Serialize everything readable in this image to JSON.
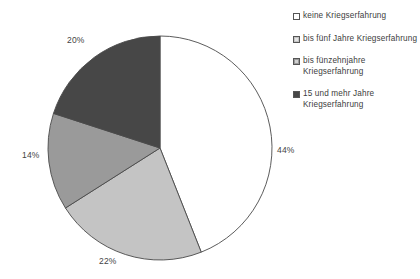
{
  "chart_data": {
    "type": "pie",
    "title": "",
    "subtitle": "",
    "xlabel": "",
    "ylabel": "",
    "grid": false,
    "legend_position": "right",
    "start_angle_deg": 0,
    "direction": "clockwise",
    "categories": [
      "keine Kriegserfahrung",
      "bis fünf Jahre Kriegserfahrung",
      "bis fünzehnjahre Kriegserfahrung",
      "15 und mehr Jahre Kriegserfahrung"
    ],
    "values": [
      44,
      22,
      14,
      20
    ],
    "value_labels": [
      "44%",
      "22%",
      "14%",
      "20%"
    ],
    "slice_colors": [
      "#ffffff",
      "#c4c4c4",
      "#9a9a9a",
      "#474747"
    ],
    "slice_edge_color": "#4a4a4a",
    "slices": [
      {
        "label": "keine Kriegserfahrung",
        "value": 44,
        "value_label": "44%",
        "color": "#ffffff"
      },
      {
        "label": "bis fünf Jahre Kriegserfahrung",
        "value": 22,
        "value_label": "22%",
        "color": "#c4c4c4"
      },
      {
        "label": "bis fünzehnjahre Kriegserfahrung",
        "value": 14,
        "value_label": "14%",
        "color": "#9a9a9a"
      },
      {
        "label": "15 und mehr Jahre Kriegserfahrung",
        "value": 20,
        "value_label": "20%",
        "color": "#474747"
      }
    ]
  },
  "legend": {
    "items": [
      {
        "label": "keine Kriegserfahrung",
        "swatch": "#ffffff",
        "swatch_style": "empty"
      },
      {
        "label": "bis fünf Jahre Kriegserfahrung",
        "swatch": "#c4c4c4",
        "swatch_style": "inner"
      },
      {
        "label": "bis fünzehnjahre Kriegserfahrung",
        "swatch": "#9a9a9a",
        "swatch_style": "inner"
      },
      {
        "label": "15 und mehr Jahre Kriegserfahrung",
        "swatch": "#474747",
        "swatch_style": "solid"
      }
    ]
  }
}
